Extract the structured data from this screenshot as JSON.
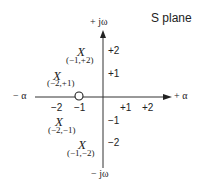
{
  "title": "S plane",
  "axes": {
    "x_pos": "+ α",
    "x_neg": "− α",
    "y_pos": "+ jω",
    "y_neg": "− jω"
  },
  "x_ticks": [
    "−2",
    "−1",
    "+1",
    "+2"
  ],
  "y_ticks": [
    "+2",
    "+1",
    "−1",
    "−2"
  ],
  "poles": [
    {
      "symbol": "X",
      "label": "(−1,+2)"
    },
    {
      "symbol": "X",
      "label": "(−2,+1)"
    },
    {
      "symbol": "X",
      "label": "(−2,−1)"
    },
    {
      "symbol": "X",
      "label": "(−1,−2)"
    }
  ],
  "zeros": [
    {
      "symbol": "O",
      "at": "−1"
    }
  ],
  "colors": {
    "ink": "#222222",
    "background": "#ffffff"
  }
}
